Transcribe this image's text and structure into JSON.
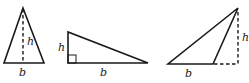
{
  "figure": {
    "stroke_color": "#1a1a1a",
    "background": "#ffffff",
    "triangles": [
      {
        "name": "acute-isosceles-triangle",
        "type": "acute",
        "base_label": "b",
        "height_label": "h",
        "height_line": "dashed, internal, from apex to base midpoint"
      },
      {
        "name": "right-triangle",
        "type": "right",
        "base_label": "b",
        "height_label": "h",
        "height_line": "solid vertical leg with right-angle marker"
      },
      {
        "name": "obtuse-triangle",
        "type": "obtuse",
        "base_label": "b",
        "height_label": "h",
        "height_line": "dashed, external, with dashed base extension"
      }
    ]
  }
}
